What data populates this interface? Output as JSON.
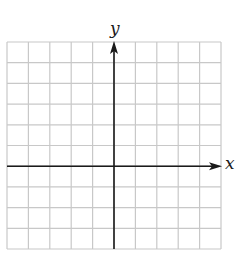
{
  "figure": {
    "type": "coordinate-grid",
    "x_axis_label": "x",
    "y_axis_label": "y",
    "grid": {
      "columns": 10,
      "rows": 10,
      "columns_left_of_y_axis": 5,
      "rows_above_x_axis": 6,
      "left": 7,
      "top": 42,
      "cell_width": 21.4,
      "cell_height": 20.7
    },
    "colors": {
      "grid_line": "#c8c8c8",
      "axis": "#1a1a1a",
      "background": "#ffffff"
    }
  }
}
